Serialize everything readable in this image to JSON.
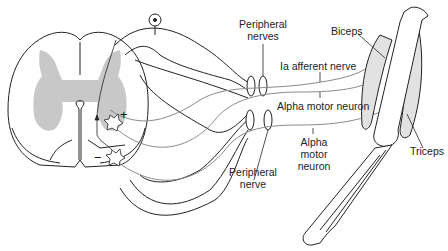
{
  "diagram": {
    "type": "anatomical-reflex-arc",
    "labels": {
      "peripheral_nerves_line1": "Peripheral",
      "peripheral_nerves_line2": "nerves",
      "ia_afferent": "Ia afferent nerve",
      "alpha_motor_top": "Alpha motor neuron",
      "biceps": "Biceps",
      "triceps": "Triceps",
      "peripheral_nerve_line1": "Peripheral",
      "peripheral_nerve_line2": "nerve",
      "alpha_motor_bottom_line1": "Alpha",
      "alpha_motor_bottom_line2": "motor",
      "alpha_motor_bottom_line3": "neuron"
    },
    "signs": {
      "excitatory": "+",
      "inhibitory": "−"
    },
    "colors": {
      "outline": "#222222",
      "gray_matter": "#c8c8c8",
      "nerve_fiber": "#8a8a8a",
      "muscle": "#e2e2e2",
      "background": "#ffffff"
    }
  }
}
